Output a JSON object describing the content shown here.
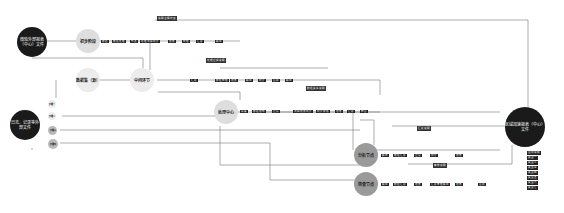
{
  "nodes": {
    "top_left_source": {
      "label": "微软外部报表（中心）文件"
    },
    "top_stage": {
      "label": "初步阶段"
    },
    "second_stage": {
      "label": "数据集（源）"
    },
    "second_hub": {
      "label": "中间环节"
    },
    "bottom_left_source": {
      "label": "日志、记录等外部文件"
    },
    "center_hub": {
      "label": "处理中心"
    },
    "lower_a": {
      "label": "分析节点"
    },
    "lower_b": {
      "label": "审查节点"
    },
    "right_target": {
      "label": "区域加速报表（中心）文件"
    },
    "left_small_1": {
      "label": "步骤一"
    },
    "left_small_2": {
      "label": "步骤二"
    },
    "left_small_3": {
      "label": "步骤三"
    },
    "left_small_4": {
      "label": "步骤四"
    }
  },
  "rows": {
    "row1": [
      "数据",
      "数据处理",
      "节点",
      "处理流程统计",
      "结果",
      "整理",
      "汇总",
      "输出"
    ],
    "row2": [
      "汇总",
      "数据整理",
      "结果",
      "输出",
      "统计",
      "合并",
      "输出"
    ],
    "row3": [
      "采集",
      "数据结构",
      "过滤",
      "流程结果统计",
      "统计表格",
      "结果",
      "汇总",
      "整合"
    ],
    "row4": [
      "输出",
      "数据汇总",
      "过滤",
      "统计",
      "结果"
    ],
    "row5": [
      "输出",
      "数据汇总",
      "结果",
      "汇总整理输出",
      "结果",
      "合并"
    ]
  },
  "notes": [
    "说明注释内容",
    "处理过程说明",
    "数据关系说明",
    "汇总说明",
    "审核说明"
  ],
  "legend": [
    "图例说明",
    "类型一",
    "类型二",
    "类型三",
    "类型四",
    "类型五",
    "类型六",
    "类型七"
  ]
}
